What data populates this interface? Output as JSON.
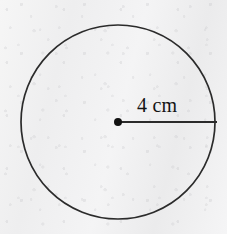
{
  "figure": {
    "kind": "geometry-diagram",
    "canvas": {
      "width": 227,
      "height": 234
    },
    "background": {
      "description": "light gray scanned paper texture",
      "color": "#f3f3f3"
    },
    "circle": {
      "name": "circle-outline",
      "center_x": 118,
      "center_y": 122,
      "radius_px": 97,
      "stroke_color": "#2b2b2b",
      "stroke_width": 1.7,
      "fill": "none"
    },
    "center_point": {
      "name": "center-dot",
      "x": 118,
      "y": 122,
      "radius_px": 4,
      "color": "#121212"
    },
    "radius_segment": {
      "name": "radius-line",
      "x1": 118,
      "y1": 122,
      "x2": 217,
      "y2": 122,
      "stroke_color": "#2b2b2b",
      "stroke_width": 1.8
    },
    "radius_label": {
      "text": "4 cm",
      "value": 4,
      "unit": "cm",
      "x": 137,
      "y": 95,
      "font_size_px": 20,
      "color": "#131313"
    }
  }
}
